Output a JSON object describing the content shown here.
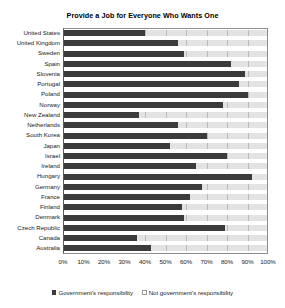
{
  "chart_data": {
    "type": "bar",
    "orientation": "horizontal",
    "stacked": true,
    "title": "Provide a Job for Everyone Who Wants One",
    "xlabel": "",
    "ylabel": "",
    "xlim": [
      0,
      100
    ],
    "xticks": [
      "0%",
      "10%",
      "20%",
      "30%",
      "40%",
      "50%",
      "60%",
      "70%",
      "80%",
      "90%",
      "100%"
    ],
    "grid": true,
    "legend_position": "bottom",
    "categories": [
      "United States",
      "United Kingdom",
      "Sweden",
      "Spain",
      "Slovenia",
      "Portugal",
      "Poland",
      "Norway",
      "New Zealand",
      "Netherlands",
      "South Korea",
      "Japan",
      "Israel",
      "Ireland",
      "Hungary",
      "Germany",
      "France",
      "Finland",
      "Denmark",
      "Czech Republic",
      "Canada",
      "Australia"
    ],
    "series": [
      {
        "name": "Government's responsibility",
        "color": "#3b3b3b",
        "values": [
          40,
          56,
          59,
          82,
          89,
          86,
          90,
          78,
          37,
          56,
          70,
          52,
          80,
          65,
          92,
          68,
          62,
          58,
          59,
          79,
          36,
          43
        ]
      },
      {
        "name": "Not government's responsibility",
        "color": "#e3e3e3",
        "values": [
          60,
          44,
          41,
          18,
          11,
          14,
          10,
          22,
          63,
          44,
          30,
          48,
          20,
          35,
          8,
          32,
          38,
          42,
          41,
          21,
          64,
          57
        ]
      }
    ],
    "legend": [
      "Government's responsibility",
      "Not government's responsibility"
    ]
  }
}
